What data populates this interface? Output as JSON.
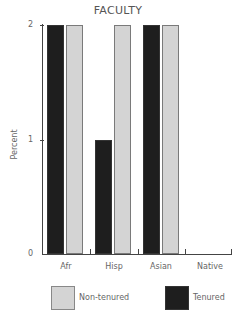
{
  "chart_data": {
    "type": "bar",
    "title": "FACULTY",
    "xlabel": "",
    "ylabel": "Percent",
    "ylim": [
      0,
      2
    ],
    "yticks": [
      "0",
      "1",
      "2"
    ],
    "categories": [
      "Afr",
      "Hisp",
      "Asian",
      "Native"
    ],
    "series": [
      {
        "name": "Tenured",
        "color": "#1e1e1e",
        "values": [
          2,
          1,
          2,
          0
        ]
      },
      {
        "name": "Non-tenured",
        "color": "#d4d4d4",
        "values": [
          2,
          2,
          2,
          0
        ]
      }
    ],
    "legend_position": "bottom",
    "grid": false
  },
  "labels": {
    "title": "FACULTY",
    "ylabel": "Percent",
    "y0": "0",
    "y1": "1",
    "y2": "2",
    "cat0": "Afr",
    "cat1": "Hisp",
    "cat2": "Asian",
    "cat3": "Native",
    "legend_non": "Non-tenured",
    "legend_ten": "Tenured"
  }
}
